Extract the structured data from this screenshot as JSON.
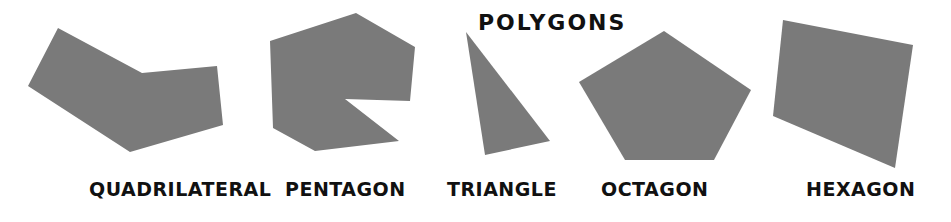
{
  "title": "POLYGONS",
  "fill_color": "#7a7a7a",
  "text_color": "#111111",
  "shapes": [
    {
      "label": "QUADRILATERAL",
      "points": "58,28 142,73 217,66 223,125 130,152 28,86",
      "label_pos": {
        "left": 89,
        "top": 180
      }
    },
    {
      "label": "PENTAGON",
      "points": "270,41 356,13 415,47 410,101 345,99 399,141 315,151 273,128",
      "label_pos": {
        "left": 285,
        "top": 180
      }
    },
    {
      "label": "TRIANGLE",
      "points": "466,32 550,141 485,155",
      "label_pos": {
        "left": 447,
        "top": 180
      }
    },
    {
      "label": "OCTAGON",
      "points": "664,31 751,90 714,160 625,160 579,82",
      "label_pos": {
        "left": 601,
        "top": 180
      }
    },
    {
      "label": "HEXAGON",
      "points": "783,20 913,45 895,168 773,116",
      "label_pos": {
        "left": 806,
        "top": 180
      }
    }
  ]
}
